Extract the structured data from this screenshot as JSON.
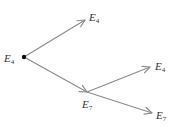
{
  "diagram": {
    "type": "tree",
    "nodes": [
      {
        "id": "root",
        "letter": "E",
        "sub": "4"
      },
      {
        "id": "top",
        "letter": "E",
        "sub": "4"
      },
      {
        "id": "mid",
        "letter": "E",
        "sub": "7"
      },
      {
        "id": "mid-up",
        "letter": "E",
        "sub": "4"
      },
      {
        "id": "mid-down",
        "letter": "E",
        "sub": "7"
      }
    ],
    "edges": [
      {
        "from": "root",
        "to": "top"
      },
      {
        "from": "root",
        "to": "mid"
      },
      {
        "from": "mid",
        "to": "mid-up"
      },
      {
        "from": "mid",
        "to": "mid-down"
      }
    ],
    "colors": {
      "edge": "#8c8c8c",
      "text": "#333333",
      "root_dot": "#111111"
    }
  }
}
